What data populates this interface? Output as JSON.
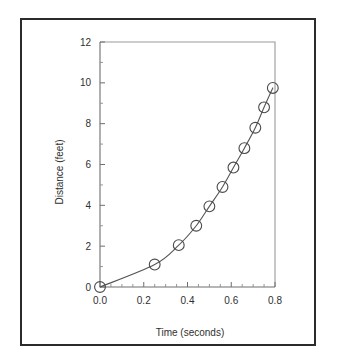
{
  "chart_data": {
    "type": "scatter",
    "title": "",
    "xlabel": "Time (seconds)",
    "ylabel": "Distance (feet)",
    "xlim": [
      0.0,
      0.8
    ],
    "ylim": [
      0,
      12
    ],
    "xticks": [
      0.0,
      0.2,
      0.4,
      0.6,
      0.8
    ],
    "xtick_labels": [
      "0.0",
      "0.2",
      "0.4",
      "0.6",
      "0.8"
    ],
    "yticks": [
      0,
      2,
      4,
      6,
      8,
      10,
      12
    ],
    "ytick_labels": [
      "0",
      "2",
      "4",
      "6",
      "8",
      "10",
      "12"
    ],
    "x_minor_ticks": [
      0.05,
      0.1,
      0.15,
      0.25,
      0.3,
      0.35,
      0.45,
      0.5,
      0.55,
      0.65,
      0.7,
      0.75
    ],
    "y_minor_ticks": [
      1,
      3,
      5,
      7,
      9,
      11
    ],
    "grid": false,
    "legend": false,
    "marker": "open-circle",
    "x": [
      0.0,
      0.25,
      0.36,
      0.44,
      0.5,
      0.56,
      0.61,
      0.66,
      0.71,
      0.75,
      0.79
    ],
    "y": [
      0.0,
      1.1,
      2.05,
      3.0,
      3.95,
      4.9,
      5.85,
      6.8,
      7.8,
      8.8,
      9.75
    ],
    "points": [
      {
        "t": 0.0,
        "d": 0.0
      },
      {
        "t": 0.25,
        "d": 1.1
      },
      {
        "t": 0.36,
        "d": 2.05
      },
      {
        "t": 0.44,
        "d": 3.0
      },
      {
        "t": 0.5,
        "d": 3.95
      },
      {
        "t": 0.56,
        "d": 4.9
      },
      {
        "t": 0.61,
        "d": 5.85
      },
      {
        "t": 0.66,
        "d": 6.8
      },
      {
        "t": 0.71,
        "d": 7.8
      },
      {
        "t": 0.75,
        "d": 8.8
      },
      {
        "t": 0.79,
        "d": 9.75
      }
    ],
    "fit_curve": true,
    "colors": {
      "axis": "#6e6e6e",
      "frame": "#9a9a9a",
      "curve": "#555555",
      "marker": "#4a4a4a",
      "border": "#2b2b2b",
      "text": "#2f2f2f",
      "background": "#ffffff"
    }
  }
}
